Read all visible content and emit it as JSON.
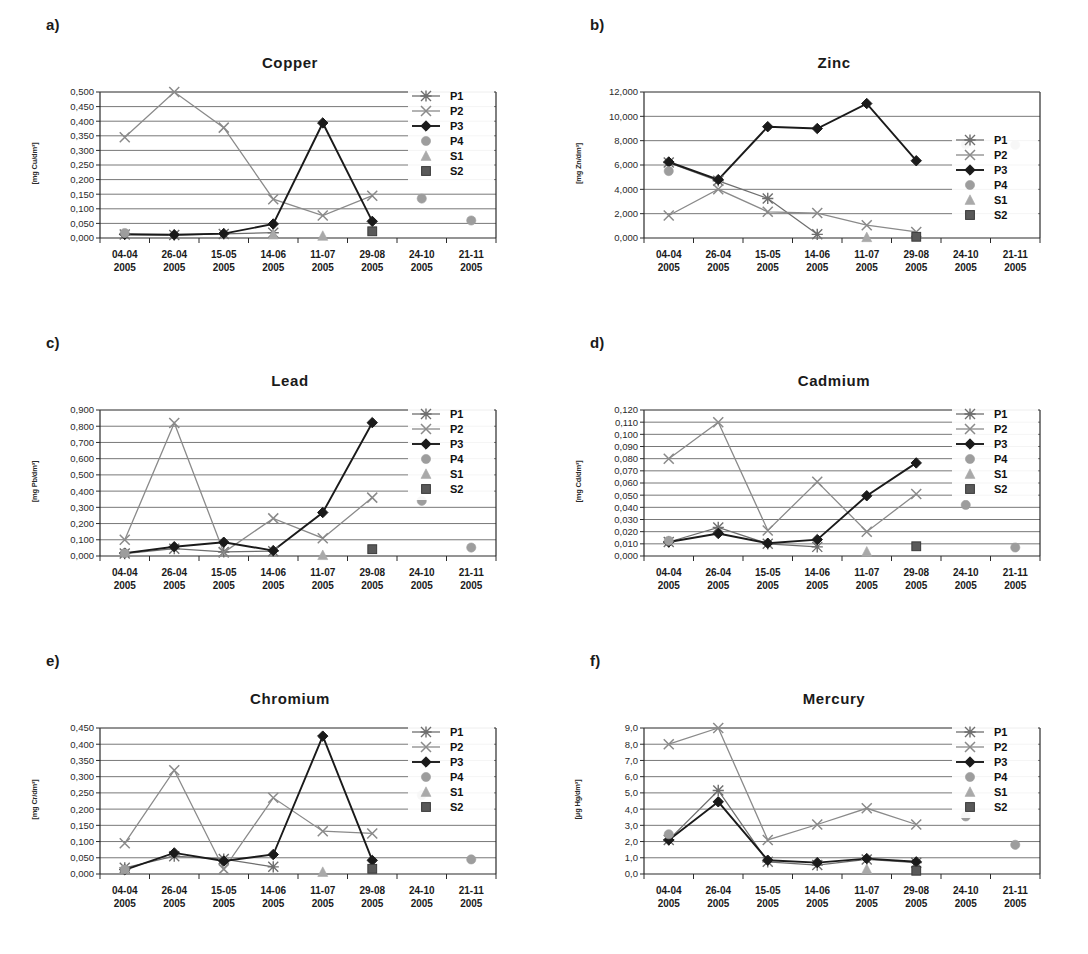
{
  "figure": {
    "background": "#ffffff",
    "series_colors": {
      "P1": "#6e6e6e",
      "P2": "#8a8a8a",
      "P3": "#1a1a1a",
      "P4": "#9d9d9d",
      "S1": "#a9a9a9",
      "S2": "#595959"
    },
    "legend_labels": [
      "P1",
      "P2",
      "P3",
      "P4",
      "S1",
      "S2"
    ],
    "x_categories": [
      "04-04\n2005",
      "26-04\n2005",
      "15-05\n2005",
      "14-06\n2005",
      "11-07\n2005",
      "29-08\n2005",
      "24-10\n2005",
      "21-11\n2005"
    ],
    "x_dates": [
      "04-04",
      "26-04",
      "15-05",
      "14-06",
      "11-07",
      "29-08",
      "24-10",
      "21-11"
    ],
    "x_year": "2005"
  },
  "panels": [
    {
      "letter": "a)",
      "chart_data": {
        "type": "line",
        "title": "Copper",
        "xlabel": "",
        "ylabel": "[mg Cu/dm³]",
        "ylim": [
          0,
          0.5
        ],
        "ytick_labels": [
          "0,000",
          "0,050",
          "0,100",
          "0,150",
          "0,200",
          "0,250",
          "0,300",
          "0,350",
          "0,400",
          "0,450",
          "0,500"
        ],
        "yticks": [
          0,
          0.05,
          0.1,
          0.15,
          0.2,
          0.25,
          0.3,
          0.35,
          0.4,
          0.45,
          0.5
        ],
        "grid": true,
        "legend_position": "top-right",
        "categories": [
          "04-04 2005",
          "26-04 2005",
          "15-05 2005",
          "14-06 2005",
          "11-07 2005",
          "29-08 2005",
          "24-10 2005",
          "21-11 2005"
        ],
        "series": [
          {
            "name": "P1",
            "marker": "asterisk",
            "line": true,
            "values": [
              0.012,
              0.01,
              0.014,
              0.018,
              null,
              null,
              null,
              null
            ]
          },
          {
            "name": "P2",
            "marker": "x",
            "line": true,
            "values": [
              0.345,
              0.5,
              0.378,
              0.133,
              0.077,
              0.145,
              null,
              null
            ]
          },
          {
            "name": "P3",
            "marker": "diamond",
            "line": true,
            "values": [
              0.013,
              0.011,
              0.015,
              0.048,
              0.394,
              0.057,
              null,
              null
            ]
          },
          {
            "name": "P4",
            "marker": "circle",
            "line": false,
            "values": [
              0.017,
              null,
              null,
              null,
              null,
              null,
              0.135,
              0.06
            ]
          },
          {
            "name": "S1",
            "marker": "triangle",
            "line": false,
            "values": [
              null,
              null,
              null,
              0.012,
              0.007,
              null,
              null,
              null
            ]
          },
          {
            "name": "S2",
            "marker": "square",
            "line": false,
            "values": [
              null,
              null,
              null,
              null,
              null,
              0.023,
              null,
              null
            ]
          }
        ]
      }
    },
    {
      "letter": "b)",
      "chart_data": {
        "type": "line",
        "title": "Zinc",
        "xlabel": "",
        "ylabel": "[mg Zn/dm³]",
        "ylim": [
          0,
          12
        ],
        "ytick_labels": [
          "0,000",
          "2,000",
          "4,000",
          "6,000",
          "8,000",
          "10,000",
          "12,000"
        ],
        "yticks": [
          0,
          2,
          4,
          6,
          8,
          10,
          12
        ],
        "grid": true,
        "legend_position": "mid-right",
        "categories": [
          "04-04 2005",
          "26-04 2005",
          "15-05 2005",
          "14-06 2005",
          "11-07 2005",
          "29-08 2005",
          "24-10 2005",
          "21-11 2005"
        ],
        "series": [
          {
            "name": "P1",
            "marker": "asterisk",
            "line": true,
            "values": [
              6.2,
              4.7,
              3.25,
              0.3,
              null,
              null,
              null,
              null
            ]
          },
          {
            "name": "P2",
            "marker": "x",
            "line": true,
            "values": [
              1.85,
              4.0,
              2.15,
              2.05,
              1.05,
              0.5,
              null,
              null
            ]
          },
          {
            "name": "P3",
            "marker": "diamond",
            "line": true,
            "values": [
              6.25,
              4.8,
              9.15,
              9.0,
              11.05,
              6.35,
              null,
              null
            ]
          },
          {
            "name": "P4",
            "marker": "circle",
            "line": false,
            "values": [
              5.5,
              null,
              null,
              null,
              null,
              null,
              7.7,
              7.65
            ]
          },
          {
            "name": "S1",
            "marker": "triangle",
            "line": false,
            "values": [
              null,
              null,
              null,
              null,
              0.06,
              null,
              null,
              null
            ]
          },
          {
            "name": "S2",
            "marker": "square",
            "line": false,
            "values": [
              null,
              null,
              null,
              null,
              null,
              0.1,
              null,
              null
            ]
          }
        ]
      }
    },
    {
      "letter": "c)",
      "chart_data": {
        "type": "line",
        "title": "Lead",
        "xlabel": "",
        "ylabel": "[mg Pb/dm³]",
        "ylim": [
          0,
          0.9
        ],
        "ytick_labels": [
          "0,000",
          "0,100",
          "0,200",
          "0,300",
          "0,400",
          "0,500",
          "0,600",
          "0,700",
          "0,800",
          "0,900"
        ],
        "yticks": [
          0,
          0.1,
          0.2,
          0.3,
          0.4,
          0.5,
          0.6,
          0.7,
          0.8,
          0.9
        ],
        "grid": true,
        "legend_position": "top-right",
        "categories": [
          "04-04 2005",
          "26-04 2005",
          "15-05 2005",
          "14-06 2005",
          "11-07 2005",
          "29-08 2005",
          "24-10 2005",
          "21-11 2005"
        ],
        "series": [
          {
            "name": "P1",
            "marker": "asterisk",
            "line": true,
            "values": [
              0.015,
              0.045,
              0.025,
              0.03,
              null,
              null,
              null,
              null
            ]
          },
          {
            "name": "P2",
            "marker": "x",
            "line": true,
            "values": [
              0.1,
              0.82,
              0.022,
              0.232,
              0.11,
              0.36,
              null,
              null
            ]
          },
          {
            "name": "P3",
            "marker": "diamond",
            "line": true,
            "values": [
              0.018,
              0.057,
              0.085,
              0.033,
              0.268,
              0.822,
              null,
              null
            ]
          },
          {
            "name": "P4",
            "marker": "circle",
            "line": false,
            "values": [
              0.017,
              null,
              null,
              null,
              null,
              null,
              0.34,
              0.052
            ]
          },
          {
            "name": "S1",
            "marker": "triangle",
            "line": false,
            "values": [
              null,
              null,
              null,
              null,
              0.005,
              null,
              null,
              null
            ]
          },
          {
            "name": "S2",
            "marker": "square",
            "line": false,
            "values": [
              null,
              null,
              null,
              null,
              null,
              0.042,
              null,
              null
            ]
          }
        ]
      }
    },
    {
      "letter": "d)",
      "chart_data": {
        "type": "line",
        "title": "Cadmium",
        "xlabel": "",
        "ylabel": "[mg Cd/dm³]",
        "ylim": [
          0,
          0.12
        ],
        "ytick_labels": [
          "0,000",
          "0,010",
          "0,020",
          "0,030",
          "0,040",
          "0,050",
          "0,060",
          "0,070",
          "0,080",
          "0,090",
          "0,100",
          "0,110",
          "0,120"
        ],
        "yticks": [
          0,
          0.01,
          0.02,
          0.03,
          0.04,
          0.05,
          0.06,
          0.07,
          0.08,
          0.09,
          0.1,
          0.11,
          0.12
        ],
        "grid": true,
        "legend_position": "top-right",
        "categories": [
          "04-04 2005",
          "26-04 2005",
          "15-05 2005",
          "14-06 2005",
          "11-07 2005",
          "29-08 2005",
          "24-10 2005",
          "21-11 2005"
        ],
        "series": [
          {
            "name": "P1",
            "marker": "asterisk",
            "line": true,
            "values": [
              0.0115,
              0.0235,
              0.01,
              0.0075,
              null,
              null,
              null,
              null
            ]
          },
          {
            "name": "P2",
            "marker": "x",
            "line": true,
            "values": [
              0.08,
              0.11,
              0.021,
              0.061,
              0.02,
              0.051,
              null,
              null
            ]
          },
          {
            "name": "P3",
            "marker": "diamond",
            "line": true,
            "values": [
              0.0115,
              0.0185,
              0.0105,
              0.0135,
              0.0495,
              0.0765,
              null,
              null
            ]
          },
          {
            "name": "P4",
            "marker": "circle",
            "line": false,
            "values": [
              0.0125,
              null,
              null,
              null,
              null,
              null,
              0.042,
              0.007
            ]
          },
          {
            "name": "S1",
            "marker": "triangle",
            "line": false,
            "values": [
              null,
              null,
              null,
              null,
              0.0035,
              null,
              null,
              null
            ]
          },
          {
            "name": "S2",
            "marker": "square",
            "line": false,
            "values": [
              null,
              null,
              null,
              null,
              null,
              0.008,
              null,
              null
            ]
          }
        ]
      }
    },
    {
      "letter": "e)",
      "chart_data": {
        "type": "line",
        "title": "Chromium",
        "xlabel": "",
        "ylabel": "[mg Cr/dm³]",
        "ylim": [
          0,
          0.45
        ],
        "ytick_labels": [
          "0,000",
          "0,050",
          "0,100",
          "0,150",
          "0,200",
          "0,250",
          "0,300",
          "0,350",
          "0,400",
          "0,450"
        ],
        "yticks": [
          0,
          0.05,
          0.1,
          0.15,
          0.2,
          0.25,
          0.3,
          0.35,
          0.4,
          0.45
        ],
        "grid": true,
        "legend_position": "top-right",
        "categories": [
          "04-04 2005",
          "26-04 2005",
          "15-05 2005",
          "14-06 2005",
          "11-07 2005",
          "29-08 2005",
          "24-10 2005",
          "21-11 2005"
        ],
        "series": [
          {
            "name": "P1",
            "marker": "asterisk",
            "line": true,
            "values": [
              0.019,
              0.055,
              0.046,
              0.022,
              null,
              null,
              null,
              null
            ]
          },
          {
            "name": "P2",
            "marker": "x",
            "line": true,
            "values": [
              0.095,
              0.32,
              0.015,
              0.235,
              0.132,
              0.125,
              null,
              null
            ]
          },
          {
            "name": "P3",
            "marker": "diamond",
            "line": true,
            "values": [
              0.013,
              0.065,
              0.04,
              0.06,
              0.425,
              0.042,
              null,
              null
            ]
          },
          {
            "name": "P4",
            "marker": "circle",
            "line": false,
            "values": [
              0.014,
              null,
              null,
              null,
              null,
              null,
              0.243,
              0.045
            ]
          },
          {
            "name": "S1",
            "marker": "triangle",
            "line": false,
            "values": [
              null,
              null,
              null,
              null,
              0.006,
              null,
              null,
              null
            ]
          },
          {
            "name": "S2",
            "marker": "square",
            "line": false,
            "values": [
              null,
              null,
              null,
              null,
              null,
              0.016,
              null,
              null
            ]
          }
        ]
      }
    },
    {
      "letter": "f)",
      "chart_data": {
        "type": "line",
        "title": "Mercury",
        "xlabel": "",
        "ylabel": "[μg Hg/dm³]",
        "ylim": [
          0,
          9
        ],
        "ytick_labels": [
          "0,0",
          "1,0",
          "2,0",
          "3,0",
          "4,0",
          "5,0",
          "6,0",
          "7,0",
          "8,0",
          "9,0"
        ],
        "yticks": [
          0,
          1,
          2,
          3,
          4,
          5,
          6,
          7,
          8,
          9
        ],
        "grid": true,
        "legend_position": "top-right",
        "categories": [
          "04-04 2005",
          "26-04 2005",
          "15-05 2005",
          "14-06 2005",
          "11-07 2005",
          "29-08 2005",
          "24-10 2005",
          "21-11 2005"
        ],
        "series": [
          {
            "name": "P1",
            "marker": "asterisk",
            "line": true,
            "values": [
              2.1,
              5.15,
              0.75,
              0.55,
              0.9,
              0.7,
              null,
              null
            ]
          },
          {
            "name": "P2",
            "marker": "x",
            "line": true,
            "values": [
              8.0,
              9.0,
              2.1,
              3.05,
              4.05,
              3.05,
              null,
              null
            ]
          },
          {
            "name": "P3",
            "marker": "diamond",
            "line": true,
            "values": [
              2.1,
              4.45,
              0.85,
              0.7,
              0.95,
              0.75,
              null,
              null
            ]
          },
          {
            "name": "P4",
            "marker": "circle",
            "line": false,
            "values": [
              2.45,
              null,
              null,
              null,
              null,
              null,
              3.55,
              1.8
            ]
          },
          {
            "name": "S1",
            "marker": "triangle",
            "line": false,
            "values": [
              null,
              null,
              null,
              null,
              0.3,
              null,
              null,
              null
            ]
          },
          {
            "name": "S2",
            "marker": "square",
            "line": false,
            "values": [
              null,
              null,
              null,
              null,
              null,
              0.2,
              null,
              null
            ]
          }
        ]
      }
    }
  ]
}
